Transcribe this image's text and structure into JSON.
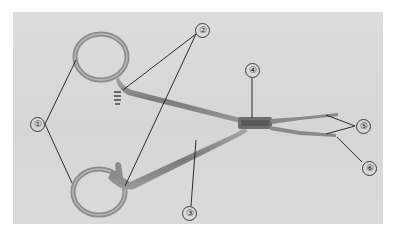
{
  "figure": {
    "background_color": "#d8d8d8",
    "instrument_color": "#8a8a8a",
    "leader_line_color": "#1a1a1a"
  },
  "labels": [
    {
      "id": "1",
      "text": "①"
    },
    {
      "id": "2",
      "text": "②"
    },
    {
      "id": "3",
      "text": "③"
    },
    {
      "id": "4",
      "text": "④"
    },
    {
      "id": "5",
      "text": "⑤"
    },
    {
      "id": "6",
      "text": "⑥"
    }
  ]
}
